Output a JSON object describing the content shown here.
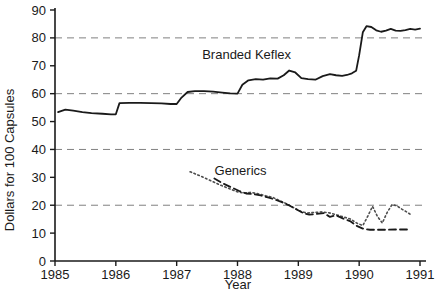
{
  "chart_data": {
    "type": "line",
    "title": "",
    "xlabel": "Year",
    "ylabel": "Dollars for 100 Capsules",
    "xlim": [
      1985,
      1991
    ],
    "ylim": [
      0,
      90
    ],
    "xticks": [
      1985,
      1986,
      1987,
      1988,
      1989,
      1990,
      1991
    ],
    "xtick_labels": [
      "1985",
      "1986",
      "1987",
      "1988",
      "1989",
      "1990",
      "1991"
    ],
    "yticks": [
      0,
      10,
      20,
      30,
      40,
      50,
      60,
      70,
      80,
      90
    ],
    "ytick_labels": [
      "0",
      "10",
      "20",
      "30",
      "40",
      "50",
      "60",
      "70",
      "80",
      "90"
    ],
    "grid": "horizontal-dashed",
    "gridlines": [
      20,
      40,
      60,
      80
    ],
    "grid_color": "#808080",
    "legend_position": "inline-annotations",
    "annotations": [
      {
        "text": "Branded Keflex",
        "x": 1988.15,
        "y": 72.5
      },
      {
        "text": "Generics",
        "x": 1988.05,
        "y": 31.0
      }
    ],
    "series": [
      {
        "name": "Branded Keflex",
        "style": "solid",
        "color": "#1a1a1a",
        "width": 1.8,
        "points": [
          [
            1985.05,
            53.4
          ],
          [
            1985.17,
            54.3
          ],
          [
            1985.3,
            53.9
          ],
          [
            1985.45,
            53.4
          ],
          [
            1985.6,
            53.0
          ],
          [
            1985.78,
            52.8
          ],
          [
            1985.92,
            52.6
          ],
          [
            1986.0,
            52.6
          ],
          [
            1986.06,
            56.6
          ],
          [
            1986.22,
            56.7
          ],
          [
            1986.4,
            56.7
          ],
          [
            1986.58,
            56.6
          ],
          [
            1986.75,
            56.5
          ],
          [
            1986.9,
            56.3
          ],
          [
            1987.0,
            56.3
          ],
          [
            1987.08,
            58.6
          ],
          [
            1987.18,
            60.6
          ],
          [
            1987.3,
            60.9
          ],
          [
            1987.45,
            60.9
          ],
          [
            1987.6,
            60.7
          ],
          [
            1987.75,
            60.4
          ],
          [
            1987.88,
            60.1
          ],
          [
            1988.0,
            60.0
          ],
          [
            1988.08,
            63.2
          ],
          [
            1988.18,
            64.8
          ],
          [
            1988.3,
            65.2
          ],
          [
            1988.42,
            65.0
          ],
          [
            1988.54,
            65.5
          ],
          [
            1988.66,
            65.4
          ],
          [
            1988.76,
            66.6
          ],
          [
            1988.85,
            68.3
          ],
          [
            1988.95,
            67.6
          ],
          [
            1989.05,
            65.6
          ],
          [
            1989.16,
            65.2
          ],
          [
            1989.28,
            65.0
          ],
          [
            1989.4,
            66.3
          ],
          [
            1989.52,
            67.0
          ],
          [
            1989.62,
            66.6
          ],
          [
            1989.72,
            66.4
          ],
          [
            1989.8,
            66.7
          ],
          [
            1989.88,
            67.3
          ],
          [
            1989.95,
            68.2
          ],
          [
            1990.0,
            73.8
          ],
          [
            1990.06,
            82.0
          ],
          [
            1990.12,
            84.2
          ],
          [
            1990.2,
            83.9
          ],
          [
            1990.28,
            82.7
          ],
          [
            1990.36,
            82.2
          ],
          [
            1990.44,
            82.6
          ],
          [
            1990.52,
            83.2
          ],
          [
            1990.6,
            82.6
          ],
          [
            1990.68,
            82.5
          ],
          [
            1990.76,
            82.8
          ],
          [
            1990.84,
            83.2
          ],
          [
            1990.92,
            83.0
          ],
          [
            1991.0,
            83.3
          ]
        ]
      },
      {
        "name": "Generics (dotted)",
        "style": "dotted",
        "color": "#4d4d4d",
        "width": 1.6,
        "points": [
          [
            1987.22,
            32.0
          ],
          [
            1987.4,
            30.4
          ],
          [
            1987.58,
            28.6
          ],
          [
            1987.72,
            27.2
          ],
          [
            1987.86,
            26.0
          ],
          [
            1988.0,
            24.8
          ],
          [
            1988.1,
            24.4
          ],
          [
            1988.22,
            24.6
          ],
          [
            1988.34,
            24.1
          ],
          [
            1988.46,
            23.4
          ],
          [
            1988.58,
            22.8
          ],
          [
            1988.7,
            21.6
          ],
          [
            1988.82,
            20.4
          ],
          [
            1988.94,
            18.9
          ],
          [
            1989.04,
            17.8
          ],
          [
            1989.14,
            17.2
          ],
          [
            1989.26,
            17.4
          ],
          [
            1989.38,
            17.6
          ],
          [
            1989.5,
            17.3
          ],
          [
            1989.62,
            16.6
          ],
          [
            1989.74,
            15.8
          ],
          [
            1989.86,
            15.0
          ],
          [
            1989.96,
            13.6
          ],
          [
            1990.06,
            12.7
          ],
          [
            1990.14,
            16.0
          ],
          [
            1990.22,
            19.6
          ],
          [
            1990.3,
            16.0
          ],
          [
            1990.38,
            13.6
          ],
          [
            1990.46,
            17.4
          ],
          [
            1990.54,
            20.2
          ],
          [
            1990.62,
            19.8
          ],
          [
            1990.7,
            18.6
          ],
          [
            1990.78,
            17.6
          ],
          [
            1990.85,
            16.6
          ]
        ]
      },
      {
        "name": "Generics (dashed)",
        "style": "dashed",
        "color": "#1a1a1a",
        "width": 1.8,
        "points": [
          [
            1987.62,
            29.6
          ],
          [
            1987.76,
            27.8
          ],
          [
            1987.9,
            26.4
          ],
          [
            1988.02,
            25.2
          ],
          [
            1988.14,
            24.2
          ],
          [
            1988.26,
            24.0
          ],
          [
            1988.38,
            23.5
          ],
          [
            1988.5,
            22.8
          ],
          [
            1988.62,
            22.0
          ],
          [
            1988.74,
            21.0
          ],
          [
            1988.86,
            19.8
          ],
          [
            1988.98,
            18.4
          ],
          [
            1989.08,
            17.2
          ],
          [
            1989.18,
            16.6
          ],
          [
            1989.3,
            16.9
          ],
          [
            1989.42,
            17.2
          ],
          [
            1989.52,
            15.8
          ],
          [
            1989.62,
            16.4
          ],
          [
            1989.74,
            15.2
          ],
          [
            1989.86,
            14.2
          ],
          [
            1989.96,
            12.6
          ],
          [
            1990.06,
            11.6
          ],
          [
            1990.18,
            11.2
          ],
          [
            1990.32,
            11.2
          ],
          [
            1990.46,
            11.2
          ],
          [
            1990.6,
            11.3
          ],
          [
            1990.74,
            11.3
          ],
          [
            1990.85,
            11.3
          ]
        ]
      }
    ]
  }
}
